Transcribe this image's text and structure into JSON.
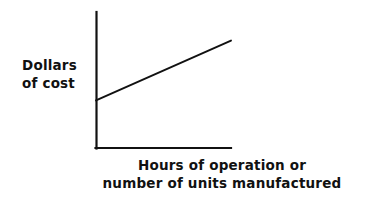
{
  "figure": {
    "background_color": "#ffffff",
    "ink_color": "#111111",
    "width": 374,
    "height": 203
  },
  "axes": {
    "y_axis_label_line1": "Dollars",
    "y_axis_label_line2": "of cost",
    "x_axis_label_line1": "Hours of operation or",
    "x_axis_label_line2": "number of units manufactured"
  },
  "chart_data": {
    "type": "line",
    "title": "",
    "subtitle": "",
    "xlabel": "Hours of operation or number of units manufactured",
    "ylabel": "Dollars of cost",
    "grid": false,
    "legend": false,
    "legend_position": "none",
    "xlim": [
      0,
      100
    ],
    "ylim": [
      0,
      100
    ],
    "x_tick_labels": [],
    "y_tick_labels": [],
    "annotations": [],
    "series": [
      {
        "name": "Mixed cost",
        "x": [
          0,
          100
        ],
        "values": [
          35,
          79
        ],
        "description": "Straight cost line rising from a positive intercept on the dollars axis"
      }
    ]
  }
}
